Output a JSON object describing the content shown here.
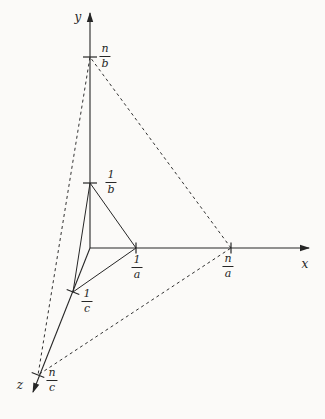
{
  "figure": {
    "background": "#fbfaf8",
    "ink": "#262626",
    "width": 325,
    "height": 419,
    "axes": {
      "x": {
        "label": "x",
        "from": [
          90,
          248
        ],
        "to": [
          309,
          248
        ],
        "label_pos": [
          305,
          264
        ]
      },
      "y": {
        "label": "y",
        "from": [
          90,
          248
        ],
        "to": [
          90,
          13
        ],
        "label_pos": [
          78,
          17
        ]
      },
      "z": {
        "label": "z",
        "from": [
          90,
          248
        ],
        "to": [
          33,
          392
        ],
        "label_pos": [
          20,
          385
        ]
      }
    },
    "planes": {
      "inner_solid": {
        "points": [
          [
            136,
            248
          ],
          [
            90,
            183
          ],
          [
            73,
            292
          ]
        ],
        "style": "solid"
      },
      "outer_dashed": {
        "points": [
          [
            231,
            248
          ],
          [
            90,
            57
          ],
          [
            38,
            375
          ]
        ],
        "style": "dashed"
      }
    },
    "ticks": [
      {
        "name": "tick-n-over-b",
        "center": [
          90,
          57
        ],
        "dir": "h"
      },
      {
        "name": "tick-1-over-b",
        "center": [
          90,
          183
        ],
        "dir": "h"
      },
      {
        "name": "tick-1-over-a",
        "center": [
          136,
          248
        ],
        "dir": "v"
      },
      {
        "name": "tick-n-over-a",
        "center": [
          231,
          248
        ],
        "dir": "v"
      },
      {
        "name": "tick-1-over-c",
        "center": [
          73,
          292
        ],
        "dir": "zperp"
      },
      {
        "name": "tick-n-over-c",
        "center": [
          38,
          375
        ],
        "dir": "zperp"
      }
    ],
    "fractions": [
      {
        "num": "n",
        "den": "b",
        "pos": [
          105,
          56
        ]
      },
      {
        "num": "1",
        "den": "b",
        "pos": [
          111,
          182
        ]
      },
      {
        "num": "1",
        "den": "a",
        "pos": [
          137,
          267
        ]
      },
      {
        "num": "n",
        "den": "a",
        "pos": [
          228,
          266
        ]
      },
      {
        "num": "1",
        "den": "c",
        "pos": [
          87,
          301
        ]
      },
      {
        "num": "n",
        "den": "c",
        "pos": [
          52,
          380
        ]
      }
    ]
  }
}
